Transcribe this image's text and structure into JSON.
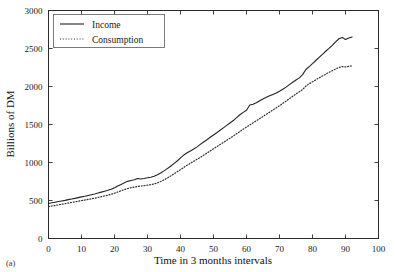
{
  "figure": {
    "panel_label": "(a)",
    "background_color": "#ffffff",
    "ink_color": "#222222"
  },
  "chart_data": {
    "type": "line",
    "title": "",
    "subtitle": "",
    "xlabel": "Time in 3 months intervals",
    "ylabel": "Billions of DM",
    "xlim": [
      0,
      100
    ],
    "ylim": [
      0,
      3000
    ],
    "xticks": [
      0,
      10,
      20,
      30,
      40,
      50,
      60,
      70,
      80,
      90,
      100
    ],
    "xtick_labels": [
      "0",
      "10",
      "20",
      "30",
      "40",
      "50",
      "60",
      "70",
      "80",
      "90",
      "100"
    ],
    "yticks": [
      0,
      500,
      1000,
      1500,
      2000,
      2500,
      3000
    ],
    "ytick_labels": [
      "0",
      "500",
      "1000",
      "1500",
      "2000",
      "2500",
      "3000"
    ],
    "grid": false,
    "legend_position": "upper left",
    "legend_entries": [
      "Income",
      "Consumption"
    ],
    "x": [
      0,
      1,
      2,
      3,
      4,
      5,
      6,
      7,
      8,
      9,
      10,
      11,
      12,
      13,
      14,
      15,
      16,
      17,
      18,
      19,
      20,
      21,
      22,
      23,
      24,
      25,
      26,
      27,
      28,
      29,
      30,
      31,
      32,
      33,
      34,
      35,
      36,
      37,
      38,
      39,
      40,
      41,
      42,
      43,
      44,
      45,
      46,
      47,
      48,
      49,
      50,
      51,
      52,
      53,
      54,
      55,
      56,
      57,
      58,
      59,
      60,
      61,
      62,
      63,
      64,
      65,
      66,
      67,
      68,
      69,
      70,
      71,
      72,
      73,
      74,
      75,
      76,
      77,
      78,
      79,
      80,
      81,
      82,
      83,
      84,
      85,
      86,
      87,
      88,
      89,
      90,
      91,
      92
    ],
    "series": [
      {
        "name": "Income",
        "style": "solid",
        "color": "#222222",
        "values": [
          460,
          470,
          478,
          486,
          494,
          502,
          512,
          520,
          528,
          538,
          548,
          556,
          566,
          576,
          586,
          598,
          610,
          622,
          634,
          648,
          668,
          690,
          712,
          734,
          752,
          764,
          772,
          790,
          782,
          790,
          800,
          806,
          818,
          838,
          862,
          890,
          920,
          950,
          985,
          1020,
          1060,
          1098,
          1128,
          1152,
          1178,
          1206,
          1238,
          1270,
          1300,
          1332,
          1362,
          1392,
          1424,
          1456,
          1488,
          1520,
          1552,
          1590,
          1628,
          1660,
          1688,
          1756,
          1766,
          1786,
          1812,
          1836,
          1858,
          1878,
          1896,
          1914,
          1938,
          1964,
          1992,
          2024,
          2056,
          2086,
          2114,
          2156,
          2224,
          2262,
          2300,
          2342,
          2384,
          2424,
          2464,
          2502,
          2542,
          2588,
          2628,
          2646,
          2618,
          2638,
          2652
        ]
      },
      {
        "name": "Consumption",
        "style": "dotted",
        "color": "#303030",
        "values": [
          420,
          428,
          434,
          442,
          450,
          458,
          466,
          474,
          482,
          490,
          498,
          506,
          514,
          522,
          530,
          540,
          550,
          560,
          570,
          582,
          596,
          612,
          628,
          644,
          658,
          668,
          676,
          686,
          690,
          696,
          702,
          708,
          718,
          732,
          750,
          772,
          796,
          822,
          850,
          878,
          906,
          936,
          964,
          990,
          1016,
          1042,
          1068,
          1096,
          1124,
          1152,
          1180,
          1208,
          1236,
          1264,
          1292,
          1320,
          1348,
          1378,
          1408,
          1438,
          1466,
          1494,
          1522,
          1550,
          1578,
          1606,
          1634,
          1662,
          1690,
          1718,
          1748,
          1778,
          1808,
          1840,
          1872,
          1902,
          1930,
          1960,
          2006,
          2036,
          2062,
          2088,
          2114,
          2138,
          2162,
          2186,
          2208,
          2230,
          2250,
          2262,
          2258,
          2264,
          2272
        ]
      }
    ]
  }
}
